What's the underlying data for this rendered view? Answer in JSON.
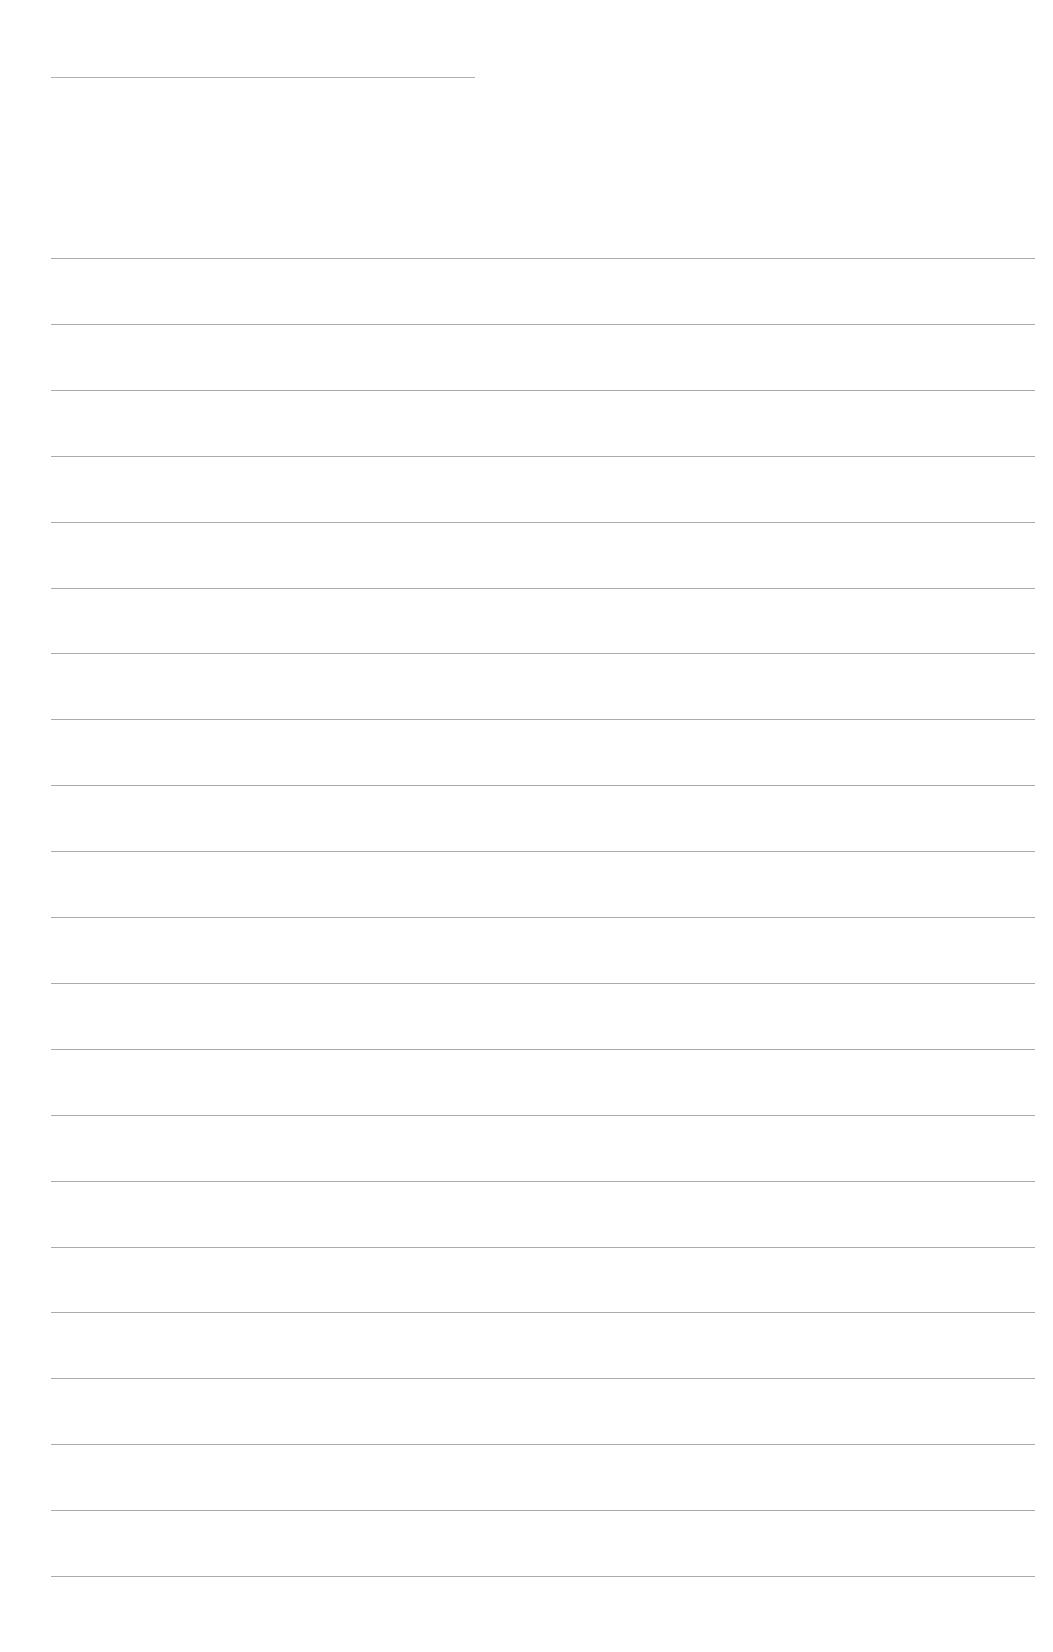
{
  "page": {
    "type": "blank-lined-sheet",
    "background": "#ffffff",
    "line_color": "#9c9c9c",
    "header_line": {
      "x": 51,
      "y": 77,
      "width": 424
    },
    "ruled_lines": {
      "count": 21,
      "x": 51,
      "width": 984,
      "first_y": 258,
      "last_y": 1576
    },
    "text": []
  }
}
